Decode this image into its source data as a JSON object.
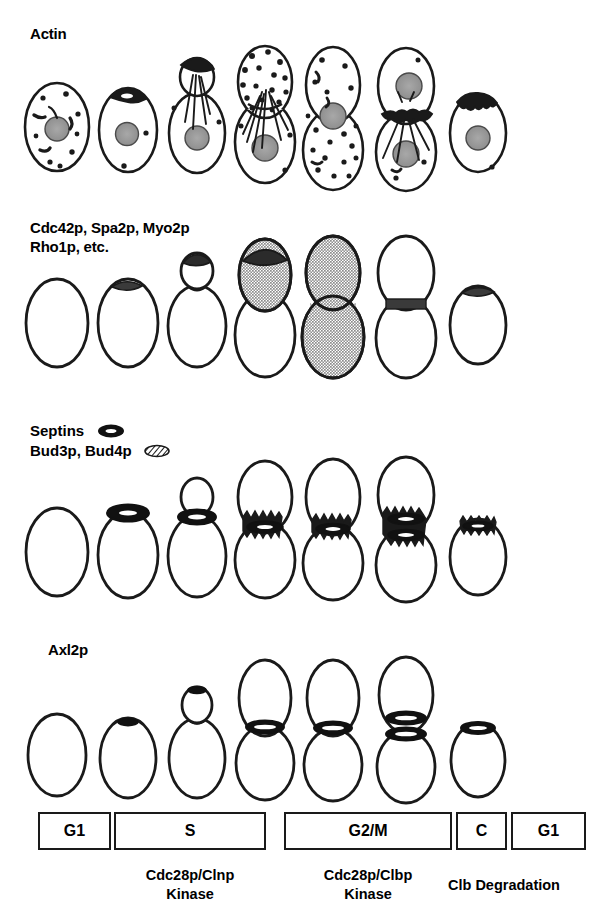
{
  "figure": {
    "title_row1": "Actin",
    "title_row2": "Cdc42p, Spa2p, Myo2p\nRho1p, etc.",
    "title_row3_line1": "Septins",
    "title_row3_line2": "Bud3p, Bud4p",
    "title_row4": "Axl2p",
    "legend": {
      "septins_icon": "solid-black-ring-icon",
      "bud34_icon": "hatched-ring-icon"
    },
    "colors": {
      "ink": "#1a1a1a",
      "nucleus_gray": "#9a9a9a",
      "cortical_gray": "#9e9e9e",
      "dark_cap": "#262626",
      "background": "#ffffff"
    }
  },
  "rows": [
    {
      "name": "actin",
      "label": "Actin",
      "stages": [
        {
          "stage": "G1 unbudded",
          "patches": 9,
          "cables": 3,
          "nucleus": "center",
          "cap": "none"
        },
        {
          "stage": "G1/S pre-bud",
          "patches": 3,
          "cables": 0,
          "nucleus": "center",
          "cap": "patch-cluster-apex"
        },
        {
          "stage": "S small bud",
          "patches": 4,
          "cables": 4,
          "nucleus": "mother-center",
          "cap": "patch-cluster-bud"
        },
        {
          "stage": "S/G2 medium bud",
          "patches": 24,
          "cables": 6,
          "nucleus": "mother-center",
          "cap": "dense-bud-patches"
        },
        {
          "stage": "G2/M large bud",
          "patches": 22,
          "cables": 2,
          "nucleus": "neck",
          "cap": "depolarized"
        },
        {
          "stage": "M/C cytokinesis",
          "patches": 7,
          "cables": 6,
          "nucleus": "two-nuclei",
          "cap": "neck-ring"
        },
        {
          "stage": "G1 daughter",
          "patches": 2,
          "cables": 0,
          "nucleus": "center",
          "cap": "patch-cluster-apex"
        }
      ]
    },
    {
      "name": "polarisome",
      "label": "Cdc42p, Spa2p, Myo2p\nRho1p, etc.",
      "stages": [
        {
          "stage": "G1 unbudded",
          "fill": "none",
          "mark": "none"
        },
        {
          "stage": "G1/S pre-bud",
          "fill": "none",
          "mark": "apex-cap"
        },
        {
          "stage": "S small bud",
          "fill": "none",
          "mark": "bud-tip-cap"
        },
        {
          "stage": "S/G2 medium bud",
          "fill": "bud-gray",
          "mark": "bud-tip-cap"
        },
        {
          "stage": "G2/M large bud",
          "fill": "whole-cell-gray",
          "mark": "none"
        },
        {
          "stage": "M/C cytokinesis",
          "fill": "none",
          "mark": "neck-band"
        },
        {
          "stage": "G1 daughter",
          "fill": "none",
          "mark": "apex-cap"
        }
      ]
    },
    {
      "name": "septins",
      "label": "Septins / Bud3p, Bud4p",
      "stages": [
        {
          "stage": "G1 unbudded",
          "ring": "none"
        },
        {
          "stage": "G1/S pre-bud",
          "ring": "solid-ring-apex"
        },
        {
          "stage": "S small bud",
          "ring": "solid-ring-neck"
        },
        {
          "stage": "S/G2 medium bud",
          "ring": "hatched-collar"
        },
        {
          "stage": "G2/M large bud",
          "ring": "hatched-collar"
        },
        {
          "stage": "M/C cytokinesis",
          "ring": "double-hatched-collar"
        },
        {
          "stage": "G1 daughter",
          "ring": "hatched-ring-scar"
        }
      ]
    },
    {
      "name": "axl2p",
      "label": "Axl2p",
      "stages": [
        {
          "stage": "G1 unbudded",
          "ring": "none"
        },
        {
          "stage": "G1/S pre-bud",
          "ring": "small-dot-apex"
        },
        {
          "stage": "S small bud",
          "ring": "solid-ring-neck"
        },
        {
          "stage": "S/G2 medium bud",
          "ring": "solid-ring-neck"
        },
        {
          "stage": "G2/M large bud",
          "ring": "solid-ring-neck"
        },
        {
          "stage": "M/C cytokinesis",
          "ring": "double-ring-neck"
        },
        {
          "stage": "G1 daughter",
          "ring": "ring-scar"
        }
      ]
    }
  ],
  "phase_bar": {
    "boxes": [
      {
        "label": "G1",
        "x": 38,
        "width": 73
      },
      {
        "label": "S",
        "x": 114,
        "width": 152
      },
      {
        "label": "G2/M",
        "x": 284,
        "width": 168
      },
      {
        "label": "C",
        "x": 456,
        "width": 51
      },
      {
        "label": "G1",
        "x": 511,
        "width": 75
      }
    ],
    "annotations": [
      {
        "text": "Cdc28p/Clnp\nKinase",
        "x": 114,
        "width": 152
      },
      {
        "text": "Cdc28p/Clbp\nKinase",
        "x": 284,
        "width": 168
      },
      {
        "text": "Clb Degradation",
        "x": 414,
        "width": 180
      }
    ]
  }
}
